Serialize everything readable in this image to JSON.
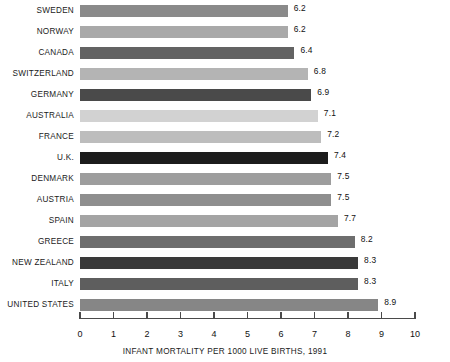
{
  "chart_data": {
    "type": "bar",
    "orientation": "horizontal",
    "title": "",
    "subtitle": "",
    "xlabel": "INFANT MORTALITY PER 1000 LIVE BIRTHS, 1991",
    "ylabel": "",
    "xlim": [
      0,
      10
    ],
    "grid": false,
    "legend": null,
    "xticks": [
      "0",
      "1",
      "2",
      "3",
      "4",
      "5",
      "6",
      "7",
      "8",
      "9",
      "10"
    ],
    "xtick_values": [
      0,
      1,
      2,
      3,
      4,
      5,
      6,
      7,
      8,
      9,
      10
    ],
    "categories": [
      "SWEDEN",
      "NORWAY",
      "CANADA",
      "SWITZERLAND",
      "GERMANY",
      "AUSTRALIA",
      "FRANCE",
      "U.K.",
      "DENMARK",
      "AUSTRIA",
      "SPAIN",
      "GREECE",
      "NEW ZEALAND",
      "ITALY",
      "UNITED STATES"
    ],
    "values": [
      6.2,
      6.2,
      6.4,
      6.8,
      6.9,
      7.1,
      7.2,
      7.4,
      7.5,
      7.5,
      7.7,
      8.2,
      8.3,
      8.3,
      8.9
    ],
    "value_labels": [
      "6.2",
      "6.2",
      "6.4",
      "6.8",
      "6.9",
      "7.1",
      "7.2",
      "7.4",
      "7.5",
      "7.5",
      "7.7",
      "8.2",
      "8.3",
      "8.3",
      "8.9"
    ],
    "bar_colors": [
      "#8a8a8a",
      "#a9a9a9",
      "#636363",
      "#b4b4b4",
      "#4a4a4a",
      "#d2d2d2",
      "#bdbdbd",
      "#1c1c1c",
      "#9d9d9d",
      "#8f8f8f",
      "#a4a4a4",
      "#6e6e6e",
      "#3a3a3a",
      "#5e5e5e",
      "#868686"
    ]
  },
  "axis_color": "#4a4a4a",
  "text_color": "#111111",
  "background_color": "#ffffff"
}
